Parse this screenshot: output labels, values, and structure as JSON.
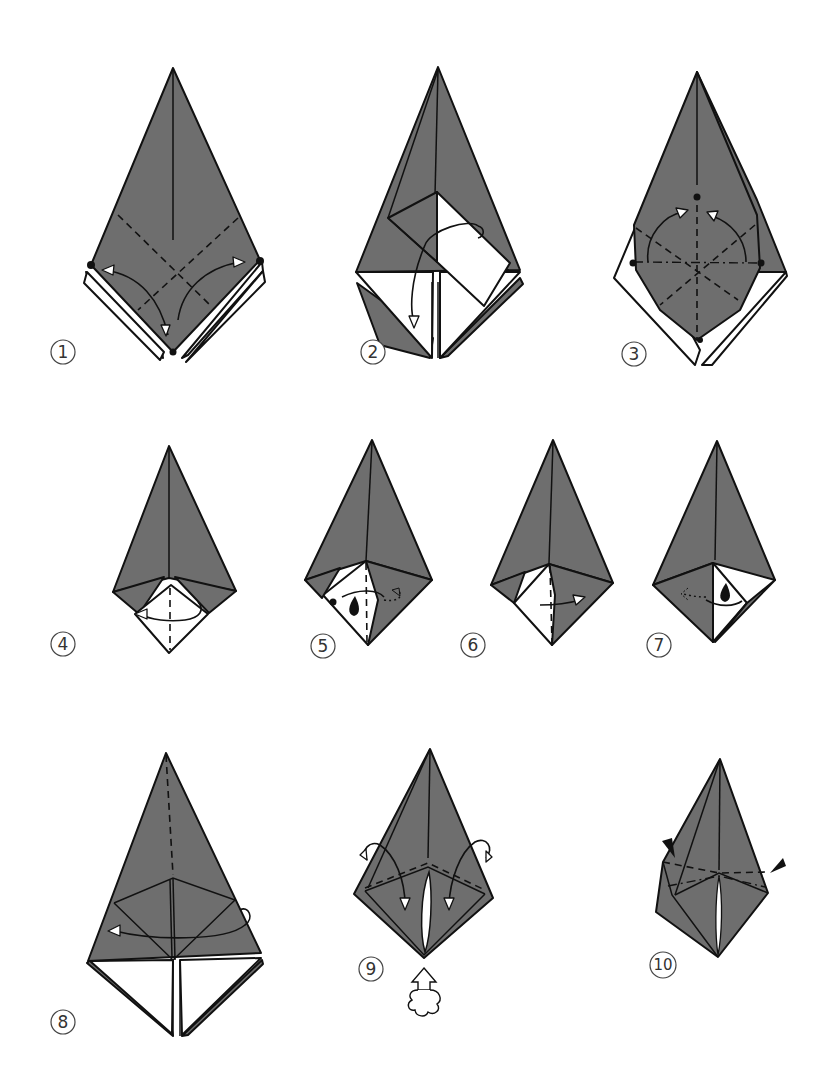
{
  "diagram": {
    "type": "origami-folding-instructions",
    "colors": {
      "paper_colored_side": "#6e6e6e",
      "paper_white_side": "#ffffff",
      "ink": "#111111"
    },
    "steps": [
      {
        "label": "1",
        "description": "Kite base with dashed valley folds crossing; arrows fold lower edges up to marked dots"
      },
      {
        "label": "2",
        "description": "Rectangular flap folded over; curved arrow indicates folding flap down"
      },
      {
        "label": "3",
        "description": "Dash-dot and dashed creases radiating from center; arrows bring side dots up to top dot"
      },
      {
        "label": "4",
        "description": "White square at bottom with center dashed crease; arrow folds right half to left"
      },
      {
        "label": "5",
        "description": "Repeat behind / open flap; eye-like drop symbol with dotted arrow to right"
      },
      {
        "label": "6",
        "description": "Fold white flap to the right along dashed line"
      },
      {
        "label": "7",
        "description": "Eye-like drop symbol; dotted arrow pointing left"
      },
      {
        "label": "8",
        "description": "Dashed vertical crease on top point; arrow wraps around to fold to left"
      },
      {
        "label": "9",
        "description": "Two side flaps folded down with arrows; push-up arrow from below"
      },
      {
        "label": "10",
        "description": "Inside reverse folds indicated by two black wedge arrows"
      }
    ],
    "symbols": {
      "valley_fold": "dashed-line",
      "mountain_fold": "dash-dot-line",
      "fold_arrow": "curved-arrow-with-hollow-head",
      "reference_point": "black-dot",
      "repeat_behind": "dotted-arrow",
      "push_arrow": "hollow-arrow-with-cloud-base",
      "reverse_fold_marker": "black-wedge"
    }
  }
}
